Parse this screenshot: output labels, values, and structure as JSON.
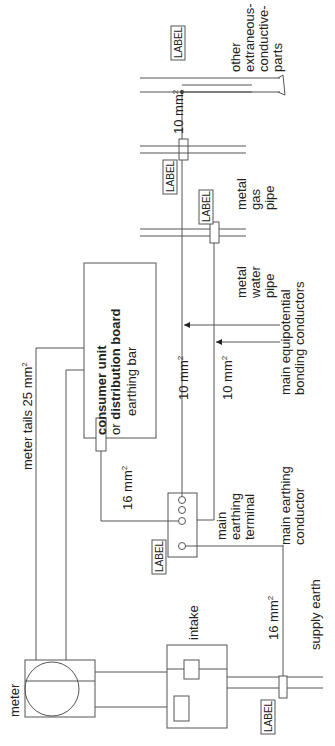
{
  "diagram": {
    "orientation": "rotated-90-ccw",
    "components": {
      "meter": {
        "label": "meter"
      },
      "intake": {
        "label": "intake"
      },
      "consumer_unit": {
        "title_bold_1": "consumer unit",
        "title_plain": "or",
        "title_bold_2": "distribution board",
        "earthing_bar": "earthing bar"
      },
      "main_earthing_terminal": {
        "label_lines": [
          "main",
          "earthing",
          "terminal"
        ]
      },
      "main_earthing_conductor": {
        "label_lines": [
          "main earthing",
          "conductor"
        ]
      },
      "supply_earth": {
        "label": "supply earth"
      },
      "water_pipe": {
        "label_lines": [
          "metal",
          "water",
          "pipe"
        ]
      },
      "gas_pipe": {
        "label_lines": [
          "metal",
          "gas",
          "pipe"
        ]
      },
      "other_parts": {
        "label_lines": [
          "other",
          "extraneous-",
          "conductive-",
          "parts"
        ]
      },
      "bonding": {
        "label_lines": [
          "main equipotential",
          "bonding conductors"
        ]
      }
    },
    "sizes": {
      "meter_tails": "meter tails 25 mm",
      "earthing_bar_cable": "16 mm",
      "main_earthing_conductor": "16 mm",
      "bonding_water": "10 mm",
      "bonding_gas": "10 mm",
      "bonding_other": "10 mm",
      "superscript": "2"
    },
    "tags": {
      "label_text": "LABEL"
    }
  }
}
